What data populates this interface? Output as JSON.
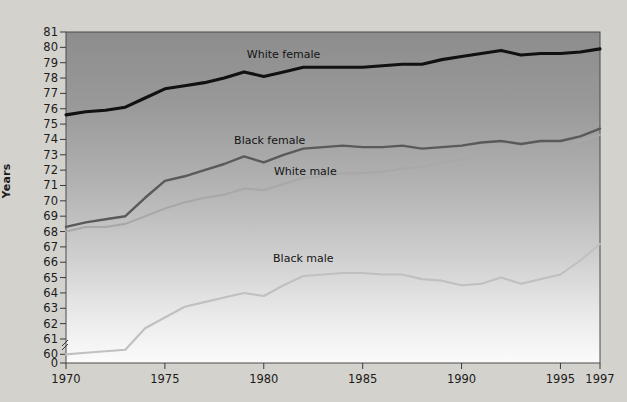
{
  "chart_data": {
    "type": "line",
    "title": "",
    "subtitle": "",
    "xlabel": "",
    "ylabel": "Years",
    "xlim": [
      1970,
      1997
    ],
    "ylim": [
      59.5,
      81
    ],
    "y_axis_break": true,
    "y_axis_break_label": "0",
    "grid": false,
    "legend_position": "inline-labels",
    "x_tick_labels": [
      "1970",
      "1975",
      "1980",
      "1985",
      "1990",
      "1995",
      "1997"
    ],
    "x_ticks": [
      1970,
      1975,
      1980,
      1985,
      1990,
      1995,
      1997
    ],
    "y_tick_labels": [
      "81",
      "80",
      "79",
      "78",
      "77",
      "76",
      "75",
      "74",
      "73",
      "72",
      "71",
      "70",
      "69",
      "68",
      "67",
      "66",
      "65",
      "64",
      "63",
      "62",
      "61",
      "60",
      "0"
    ],
    "y_ticks": [
      81,
      80,
      79,
      78,
      77,
      76,
      75,
      74,
      73,
      72,
      71,
      70,
      69,
      68,
      67,
      66,
      65,
      64,
      63,
      62,
      61,
      60
    ],
    "x": [
      1970,
      1971,
      1972,
      1973,
      1974,
      1975,
      1976,
      1977,
      1978,
      1979,
      1980,
      1981,
      1982,
      1983,
      1984,
      1985,
      1986,
      1987,
      1988,
      1989,
      1990,
      1991,
      1992,
      1993,
      1994,
      1995,
      1996,
      1997
    ],
    "series": [
      {
        "name": "White female",
        "color": "#111111",
        "label_x": 1981.0,
        "label_y": 79.5,
        "values": [
          75.6,
          75.8,
          75.9,
          76.1,
          76.7,
          77.3,
          77.5,
          77.7,
          78.0,
          78.4,
          78.1,
          78.4,
          78.7,
          78.7,
          78.7,
          78.7,
          78.8,
          78.9,
          78.9,
          79.2,
          79.4,
          79.6,
          79.8,
          79.5,
          79.6,
          79.6,
          79.7,
          79.9
        ]
      },
      {
        "name": "Black female",
        "color": "#5a5a5a",
        "label_x": 1980.3,
        "label_y": 73.9,
        "values": [
          68.3,
          68.6,
          68.8,
          69.0,
          70.2,
          71.3,
          71.6,
          72.0,
          72.4,
          72.9,
          72.5,
          73.0,
          73.4,
          73.5,
          73.6,
          73.5,
          73.5,
          73.6,
          73.4,
          73.5,
          73.6,
          73.8,
          73.9,
          73.7,
          73.9,
          73.9,
          74.2,
          74.7
        ]
      },
      {
        "name": "White male",
        "color": "#a8a8a8",
        "label_x": 1982.1,
        "label_y": 71.9,
        "values": [
          68.0,
          68.3,
          68.3,
          68.5,
          69.0,
          69.5,
          69.9,
          70.2,
          70.4,
          70.8,
          70.7,
          71.1,
          71.5,
          71.6,
          71.8,
          71.8,
          71.9,
          72.1,
          72.2,
          72.5,
          72.7,
          72.9,
          73.2,
          73.1,
          73.3,
          73.4,
          73.9,
          74.3
        ]
      },
      {
        "name": "Black male",
        "color": "#c0c0c0",
        "label_x": 1982.0,
        "label_y": 66.2,
        "values": [
          60.0,
          60.1,
          60.2,
          60.3,
          61.7,
          62.4,
          63.1,
          63.4,
          63.7,
          64.0,
          63.8,
          64.5,
          65.1,
          65.2,
          65.3,
          65.3,
          65.2,
          65.2,
          64.9,
          64.8,
          64.5,
          64.6,
          65.0,
          64.6,
          64.9,
          65.2,
          66.1,
          67.2
        ]
      }
    ]
  }
}
